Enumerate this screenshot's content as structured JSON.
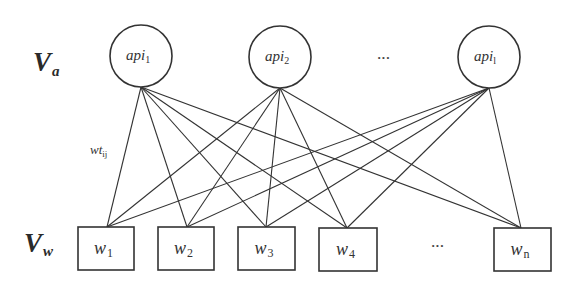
{
  "diagram": {
    "type": "bipartite-graph",
    "colors": {
      "stroke": "#333333",
      "background": "#ffffff"
    },
    "sets": {
      "api": {
        "label": "V",
        "sub": "a"
      },
      "word": {
        "label": "V",
        "sub": "w"
      }
    },
    "api_nodes": [
      {
        "id": "api1",
        "base": "api",
        "sub": "1",
        "cx": 141,
        "cy": 56,
        "r": 31
      },
      {
        "id": "api2",
        "base": "api",
        "sub": "2",
        "cx": 280,
        "cy": 57,
        "r": 31
      },
      {
        "id": "apil",
        "base": "api",
        "sub": "l",
        "cx": 489,
        "cy": 57,
        "r": 31
      }
    ],
    "api_ellipsis": {
      "text": "···",
      "x": 384,
      "y": 62
    },
    "word_nodes": [
      {
        "id": "w1",
        "base": "w",
        "sub": "1",
        "x": 78,
        "y": 227,
        "w": 56,
        "h": 43,
        "anchor_x": 107
      },
      {
        "id": "w2",
        "base": "w",
        "sub": "2",
        "x": 158,
        "y": 227,
        "w": 56,
        "h": 43,
        "anchor_x": 187
      },
      {
        "id": "w3",
        "base": "w",
        "sub": "3",
        "x": 238,
        "y": 227,
        "w": 57,
        "h": 43,
        "anchor_x": 266
      },
      {
        "id": "w4",
        "base": "w",
        "sub": "4",
        "x": 319,
        "y": 228,
        "w": 58,
        "h": 43,
        "anchor_x": 347
      },
      {
        "id": "wn",
        "base": "w",
        "sub": "n",
        "x": 494,
        "y": 228,
        "w": 57,
        "h": 43,
        "anchor_x": 521
      }
    ],
    "word_ellipsis": {
      "text": "···",
      "x": 438,
      "y": 250
    },
    "edge_label": {
      "base": "wt",
      "sub": "ij",
      "x": 90,
      "y": 154
    },
    "edges": [
      [
        "api1",
        "w1"
      ],
      [
        "api1",
        "w2"
      ],
      [
        "api1",
        "w3"
      ],
      [
        "api1",
        "w4"
      ],
      [
        "api1",
        "wn"
      ],
      [
        "api2",
        "w1"
      ],
      [
        "api2",
        "w2"
      ],
      [
        "api2",
        "w3"
      ],
      [
        "api2",
        "w4"
      ],
      [
        "api2",
        "wn"
      ],
      [
        "apil",
        "w1"
      ],
      [
        "apil",
        "w2"
      ],
      [
        "apil",
        "w3"
      ],
      [
        "apil",
        "w4"
      ],
      [
        "apil",
        "wn"
      ]
    ]
  }
}
